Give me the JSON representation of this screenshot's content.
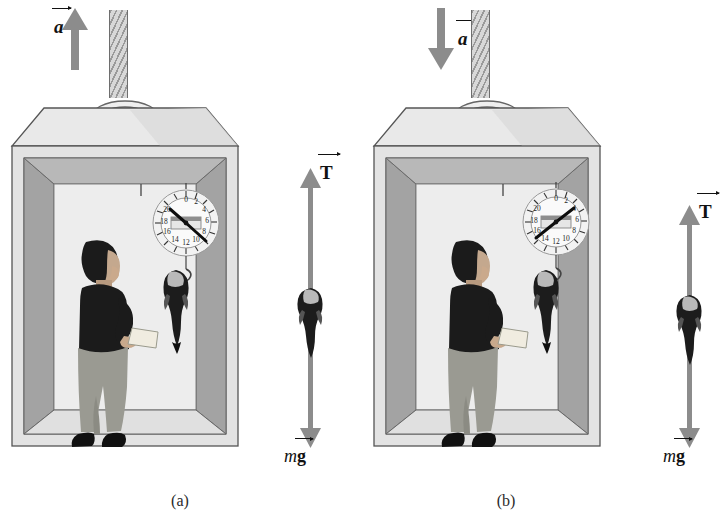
{
  "figure": {
    "panels": [
      {
        "id": "a",
        "caption": "(a)",
        "acceleration": {
          "label": "a",
          "direction": "up",
          "arrow_name": "acceleration-arrow-up"
        },
        "free_body": {
          "tension_label": "T",
          "weight_label_mass": "m",
          "weight_label_gravity": "g",
          "tension_direction": "up",
          "weight_direction": "down",
          "tension_magnitude_relative": "greater",
          "description": "T greater than mg"
        },
        "scale": {
          "ticks": [
            "0",
            "2",
            "4",
            "6",
            "8",
            "10",
            "12",
            "14",
            "16",
            "18",
            "20"
          ],
          "needle_reading": "7",
          "needle_angle_deg": 122
        },
        "cable": {
          "name": "support-cable"
        },
        "occupant": {
          "name": "man-with-clipboard"
        },
        "fish": {
          "name": "hanging-fish"
        }
      },
      {
        "id": "b",
        "caption": "(b)",
        "acceleration": {
          "label": "a",
          "direction": "down",
          "arrow_name": "acceleration-arrow-down"
        },
        "free_body": {
          "tension_label": "T",
          "weight_label_mass": "m",
          "weight_label_gravity": "g",
          "tension_direction": "up",
          "weight_direction": "down",
          "tension_magnitude_relative": "less",
          "description": "T less than mg"
        },
        "scale": {
          "ticks": [
            "0",
            "2",
            "4",
            "6",
            "8",
            "10",
            "12",
            "14",
            "16",
            "18",
            "20"
          ],
          "needle_reading": "4",
          "needle_angle_deg": 62
        },
        "cable": {
          "name": "support-cable"
        },
        "occupant": {
          "name": "man-with-clipboard"
        },
        "fish": {
          "name": "hanging-fish"
        }
      }
    ]
  },
  "colors": {
    "arrow_gray": "#8c8c8c",
    "box_top": "#e9e9e9",
    "box_wall_light": "#d7d7d7",
    "box_wall_dark": "#9e9e9e",
    "outline": "#555555",
    "shirt": "#1b1b1b",
    "pants": "#9a9a92",
    "text": "#222222",
    "cable_gray": "#cfcfcf"
  }
}
